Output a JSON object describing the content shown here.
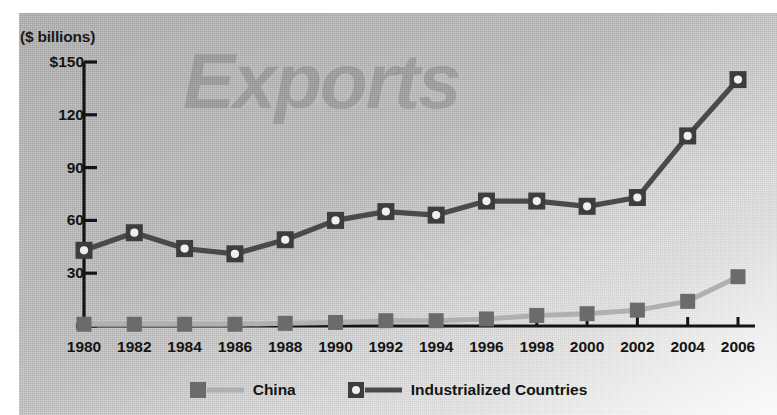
{
  "figure": {
    "units_label": "($ billions)",
    "watermark": "Exports",
    "background_color": "#bcbcbc",
    "ink_color": "#1a1a1a"
  },
  "legend": {
    "position": "bottom-center",
    "entries": [
      {
        "label": "China",
        "marker": "filled-square",
        "marker_color": "#6b6b6b",
        "line_color": "#b0b0b0"
      },
      {
        "label": "Industrialized Countries",
        "marker": "square-with-white-center",
        "marker_color": "#3d3d3d",
        "line_color": "#4a4a4a"
      }
    ]
  },
  "chart_data": {
    "type": "line",
    "title": "Exports",
    "xlabel": "",
    "ylabel": "($ billions)",
    "ylim": [
      0,
      150
    ],
    "yticks": [
      0,
      30,
      60,
      90,
      120,
      150
    ],
    "ytick_labels": [
      "0",
      "30",
      "60",
      "90",
      "120",
      "$150"
    ],
    "grid": false,
    "categories": [
      1980,
      1982,
      1984,
      1986,
      1988,
      1990,
      1992,
      1994,
      1996,
      1998,
      2000,
      2002,
      2004,
      2006
    ],
    "xtick_labels": [
      "1980",
      "1982",
      "1984",
      "1986",
      "1988",
      "1990",
      "1992",
      "1994",
      "1996",
      "1998",
      "2000",
      "2002",
      "2004",
      "2006"
    ],
    "series": [
      {
        "name": "Industrialized Countries",
        "values": [
          43,
          53,
          44,
          41,
          49,
          60,
          65,
          63,
          71,
          71,
          68,
          73,
          108,
          140
        ]
      },
      {
        "name": "China",
        "values": [
          1,
          1,
          1,
          1,
          1.5,
          2,
          3,
          3,
          4,
          6,
          7,
          9,
          14,
          28
        ]
      }
    ]
  }
}
